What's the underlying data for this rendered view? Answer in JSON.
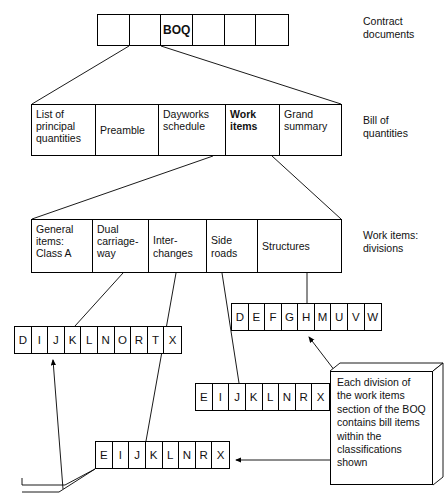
{
  "diagram": {
    "line_color": "#000000",
    "background": "#ffffff"
  },
  "rows": {
    "contract": {
      "label": "Contract\ndocuments",
      "cells": [
        "",
        "",
        "BOQ",
        "",
        "",
        ""
      ]
    },
    "bill": {
      "label": "Bill of\nquantities",
      "cells": [
        {
          "text": "List of\nprincipal\nquantities",
          "bold": false
        },
        {
          "text": "Preamble",
          "bold": false
        },
        {
          "text": "Dayworks\nschedule",
          "bold": false
        },
        {
          "text": "Work\nitems",
          "bold": true
        },
        {
          "text": "Grand\nsummary",
          "bold": false
        }
      ]
    },
    "divisions": {
      "label": "Work items:\ndivisions",
      "cells": [
        {
          "text": "General\nitems:\nClass A"
        },
        {
          "text": "Dual\ncarriage-\nway"
        },
        {
          "text": "Inter-\nchanges"
        },
        {
          "text": "Side\nroads"
        },
        {
          "text": "Structures"
        }
      ]
    }
  },
  "letter_rows": {
    "general_items_class_a": [
      "D",
      "I",
      "J",
      "K",
      "L",
      "N",
      "O",
      "R",
      "T",
      "X"
    ],
    "structures": [
      "D",
      "E",
      "F",
      "G",
      "H",
      "M",
      "U",
      "V",
      "W"
    ],
    "side_roads": [
      "E",
      "I",
      "J",
      "K",
      "L",
      "N",
      "R",
      "X"
    ],
    "interchanges": [
      "E",
      "I",
      "J",
      "K",
      "L",
      "N",
      "R",
      "X"
    ]
  },
  "note": {
    "text": "Each division of the work items section of the BOQ contains bill items within the classifications shown"
  }
}
